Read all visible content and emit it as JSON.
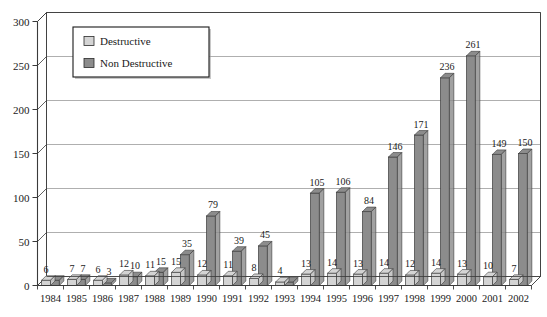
{
  "chart_data": {
    "type": "bar",
    "title": "",
    "subtitle": "",
    "xlabel": "",
    "ylabel": "",
    "ylim": [
      0,
      300
    ],
    "yticks": [
      0,
      50,
      100,
      150,
      200,
      250,
      300
    ],
    "ytick_labels": [
      "0",
      "50",
      "100",
      "150",
      "200",
      "250",
      "300"
    ],
    "grid": true,
    "grid_axis": "y",
    "legend_position": "upper-left",
    "categories": [
      "1984",
      "1985",
      "1986",
      "1987",
      "1988",
      "1989",
      "1990",
      "1991",
      "1992",
      "1993",
      "1994",
      "1995",
      "1996",
      "1997",
      "1998",
      "1999",
      "2000",
      "2001",
      "2002"
    ],
    "series": [
      {
        "name": "Destructive",
        "color": "#d4d4d4",
        "values": [
          6,
          7,
          6,
          12,
          11,
          15,
          12,
          11,
          8,
          4,
          13,
          14,
          13,
          14,
          12,
          14,
          13,
          10,
          7
        ]
      },
      {
        "name": "Non Destructive",
        "color": "#8c8c8c",
        "values": [
          6,
          7,
          3,
          10,
          15,
          35,
          79,
          39,
          45,
          4,
          105,
          106,
          84,
          146,
          171,
          236,
          261,
          149,
          150
        ]
      }
    ],
    "data_labels": {
      "Destructive": [
        "6",
        "7",
        "6",
        "12",
        "11",
        "15",
        "12",
        "11",
        "8",
        "4",
        "13",
        "14",
        "13",
        "14",
        "12",
        "14",
        "13",
        "10",
        "7"
      ],
      "Non Destructive": [
        "",
        "7",
        "3",
        "10",
        "15",
        "35",
        "79",
        "39",
        "45",
        "",
        "105",
        "106",
        "84",
        "146",
        "171",
        "236",
        "261",
        "149",
        "150"
      ]
    }
  },
  "legend": {
    "items": [
      {
        "label": "Destructive",
        "swatch_color": "#d4d4d4"
      },
      {
        "label": "Non Destructive",
        "swatch_color": "#8c8c8c"
      }
    ]
  },
  "colors": {
    "destructive": "#d4d4d4",
    "non_destructive": "#8c8c8c",
    "axis": "#3a3a3a",
    "grid": "#9a9a9a",
    "background": "#ffffff",
    "text": "#1a1a1a"
  }
}
